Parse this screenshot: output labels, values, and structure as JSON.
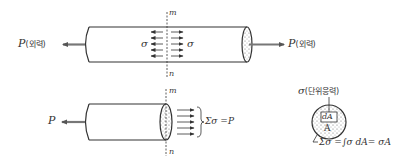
{
  "colors": {
    "stroke": "#333333",
    "arrow": "#666666",
    "stipple": "#555555",
    "background": "#ffffff"
  },
  "top_figure": {
    "left_force_label": "P",
    "left_force_note": "(외력)",
    "right_force_label": "P",
    "right_force_note": "(외력)",
    "section_top_label": "m",
    "section_bottom_label": "n",
    "stress_left_label": "σ",
    "stress_right_label": "σ"
  },
  "bottom_figure": {
    "force_label": "P",
    "section_top_label": "m",
    "section_bottom_label": "n",
    "sum_equation": "Σσ =P"
  },
  "cross_section": {
    "stress_label": "σ",
    "stress_note": "(단위응력)",
    "element_label": "dA",
    "area_label": "A",
    "integral_equation": "Σσ =∫σ dA= σA"
  }
}
